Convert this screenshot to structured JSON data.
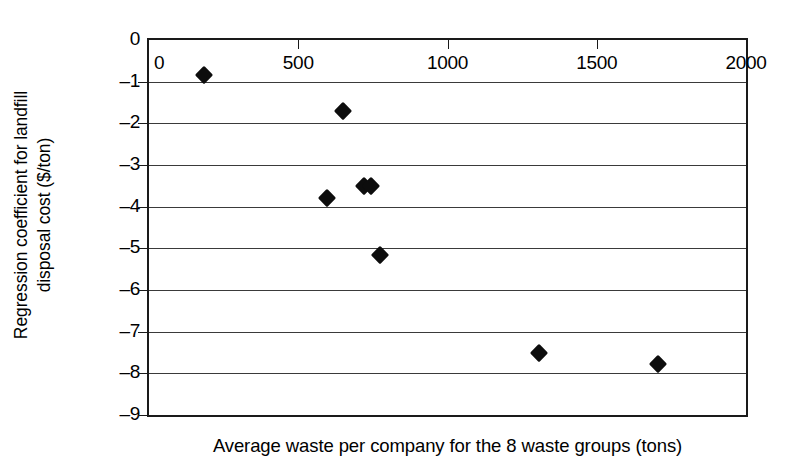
{
  "chart_data": {
    "type": "scatter",
    "title": "",
    "xlabel": "Average waste per company for the 8 waste groups (tons)",
    "ylabel_line1": "Regression coefficient for landfill",
    "ylabel_line2": "disposal cost ($/ton)",
    "xlim": [
      0,
      2000
    ],
    "ylim": [
      -9,
      0
    ],
    "xticks": [
      0,
      500,
      1000,
      1500,
      2000
    ],
    "xticklabels": [
      "0",
      "500",
      "1000",
      "1500",
      "2000"
    ],
    "yticks": [
      0,
      -1,
      -2,
      -3,
      -4,
      -5,
      -6,
      -7,
      -8,
      -9
    ],
    "yticklabels": [
      "0",
      "–1",
      "–2",
      "–3",
      "–4",
      "–5",
      "–6",
      "–7",
      "–8",
      "–9"
    ],
    "grid": "horizontal",
    "legend": "none",
    "marker": "diamond",
    "marker_color": "#0d0d0d",
    "axis_position": "x-axis-top",
    "points": [
      {
        "x": 185,
        "y": -0.85
      },
      {
        "x": 650,
        "y": -1.7
      },
      {
        "x": 595,
        "y": -3.8
      },
      {
        "x": 720,
        "y": -3.5
      },
      {
        "x": 745,
        "y": -3.5
      },
      {
        "x": 775,
        "y": -5.15
      },
      {
        "x": 1305,
        "y": -7.52
      },
      {
        "x": 1705,
        "y": -7.78
      }
    ]
  }
}
